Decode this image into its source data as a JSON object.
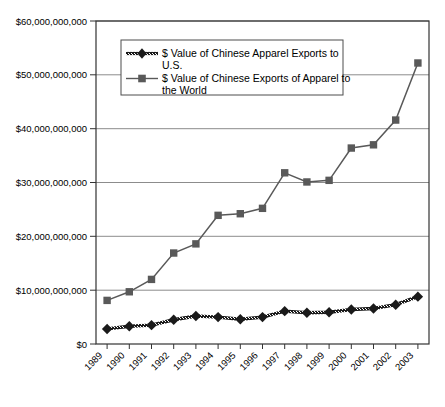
{
  "chart_data": {
    "type": "line",
    "title": "",
    "subtitle": "",
    "xlabel": "",
    "ylabel": "",
    "grid": true,
    "legend_position": "top-center-inside",
    "categories": [
      "1989",
      "1990",
      "1991",
      "1992",
      "1993",
      "1994",
      "1995",
      "1996",
      "1997",
      "1998",
      "1999",
      "2000",
      "2001",
      "2002",
      "2003"
    ],
    "x": [
      "1989",
      "1990",
      "1991",
      "1992",
      "1993",
      "1994",
      "1995",
      "1996",
      "1997",
      "1998",
      "1999",
      "2000",
      "2001",
      "2002",
      "2003"
    ],
    "ylim": [
      0,
      60000000000
    ],
    "ytick_values": [
      0,
      10000000000,
      20000000000,
      30000000000,
      40000000000,
      50000000000,
      60000000000
    ],
    "ytick_labels": [
      "$0",
      "$10,000,000,000",
      "$20,000,000,000",
      "$30,000,000,000",
      "$40,000,000,000",
      "$50,000,000,000",
      "$60,000,000,000"
    ],
    "series": [
      {
        "name": "$ Value of Chinese Apparel Exports to U.S.",
        "marker": "diamond",
        "color": "#1a1a1a",
        "values": [
          2800000000,
          3300000000,
          3500000000,
          4500000000,
          5200000000,
          5000000000,
          4600000000,
          5000000000,
          6100000000,
          5800000000,
          5900000000,
          6400000000,
          6600000000,
          7300000000,
          8800000000
        ]
      },
      {
        "name": "$ Value of Chinese Exports of Apparel to the World",
        "marker": "square",
        "color": "#595959",
        "values": [
          8100000000,
          9700000000,
          12000000000,
          16900000000,
          18600000000,
          23900000000,
          24200000000,
          25200000000,
          31800000000,
          30100000000,
          30400000000,
          36400000000,
          37000000000,
          41600000000,
          52200000000
        ]
      }
    ]
  },
  "legend": {
    "items": [
      {
        "label_line1": "$ Value of Chinese Apparel Exports to",
        "label_line2": "U.S."
      },
      {
        "label_line1": "$ Value of Chinese Exports of Apparel to",
        "label_line2": "the World"
      }
    ]
  }
}
